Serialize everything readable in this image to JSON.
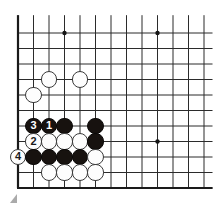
{
  "canvas": {
    "width": 216,
    "height": 207,
    "background": "#ffffff"
  },
  "board": {
    "type": "go-board-diagram",
    "description": "Partial go board diagram showing a corner joseki / life-and-death sequence with numbered moves",
    "origin": {
      "x": 18,
      "y": 33
    },
    "spacing": 15.5,
    "cols": 13,
    "rows": 11,
    "line_color": "#2b2b2b",
    "line_width": 1,
    "edge_color": "#1a1a1a",
    "edge_width": 2.2,
    "edges": {
      "left": true,
      "bottom": true,
      "top": false,
      "right": false
    },
    "star_point_color": "#151515",
    "star_point_radius": 2.2,
    "star_points": [
      {
        "col": 3,
        "row": 0
      },
      {
        "col": 9,
        "row": 0
      },
      {
        "col": 9,
        "row": 7
      }
    ]
  },
  "stones": [
    {
      "color": "white",
      "col": 2,
      "row": 3,
      "label": ""
    },
    {
      "color": "white",
      "col": 4,
      "row": 3,
      "label": ""
    },
    {
      "color": "white",
      "col": 1,
      "row": 4,
      "label": ""
    },
    {
      "color": "black",
      "col": 1,
      "row": 6,
      "label": "3"
    },
    {
      "color": "black",
      "col": 2,
      "row": 6,
      "label": "1"
    },
    {
      "color": "black",
      "col": 3,
      "row": 6,
      "label": ""
    },
    {
      "color": "black",
      "col": 5,
      "row": 6,
      "label": ""
    },
    {
      "color": "white",
      "col": 1,
      "row": 7,
      "label": "2"
    },
    {
      "color": "white",
      "col": 2,
      "row": 7,
      "label": ""
    },
    {
      "color": "white",
      "col": 3,
      "row": 7,
      "label": ""
    },
    {
      "color": "white",
      "col": 4,
      "row": 7,
      "label": ""
    },
    {
      "color": "black",
      "col": 5,
      "row": 7,
      "label": ""
    },
    {
      "color": "white",
      "col": 0,
      "row": 8,
      "label": "4"
    },
    {
      "color": "black",
      "col": 1,
      "row": 8,
      "label": ""
    },
    {
      "color": "black",
      "col": 2,
      "row": 8,
      "label": ""
    },
    {
      "color": "black",
      "col": 3,
      "row": 8,
      "label": ""
    },
    {
      "color": "black",
      "col": 4,
      "row": 8,
      "label": ""
    },
    {
      "color": "white",
      "col": 5,
      "row": 8,
      "label": ""
    },
    {
      "color": "white",
      "col": 2,
      "row": 9,
      "label": ""
    },
    {
      "color": "white",
      "col": 3,
      "row": 9,
      "label": ""
    },
    {
      "color": "white",
      "col": 4,
      "row": 9,
      "label": ""
    },
    {
      "color": "white",
      "col": 5,
      "row": 9,
      "label": ""
    }
  ],
  "move_sequence": [
    {
      "number": "1",
      "color": "black"
    },
    {
      "number": "2",
      "color": "white"
    },
    {
      "number": "3",
      "color": "black"
    },
    {
      "number": "4",
      "color": "white"
    }
  ],
  "annotations": {
    "highlight_line": {
      "name": "blue-highlight-line",
      "start_col": 5,
      "end_col": 13,
      "row": 8,
      "start_color": "#4a46c8",
      "end_color": "#d8e48a",
      "thickness": 2.6
    },
    "corner_artifact": {
      "name": "corner-triangle-artifact",
      "x": 10,
      "y": 194,
      "color": "#9b9b9b"
    }
  }
}
